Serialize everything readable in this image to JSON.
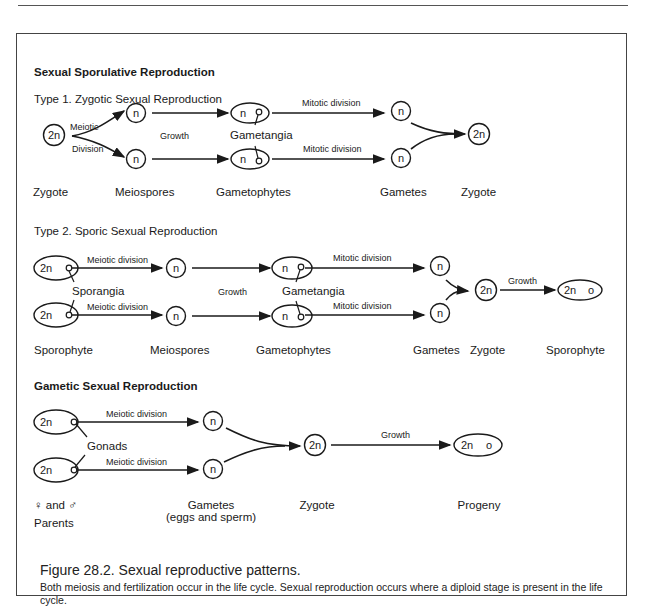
{
  "sections": {
    "sporulative_title": "Sexual Sporulative Reproduction",
    "type1": {
      "title": "Type 1.  Zygotic Sexual Reproduction",
      "arrow_meiotic_top": "Meiotic",
      "arrow_meiotic_bottom": "Division",
      "growth": "Growth",
      "gametangia": "Gametangia",
      "mitotic_top": "Mitotic division",
      "mitotic_bottom": "Mitotic division",
      "nodes": {
        "zygote": "2n",
        "meiospore": "n",
        "gametophyte_n": "n",
        "gamete": "n",
        "zygote_final": "2n"
      },
      "stage_labels": [
        "Zygote",
        "Meiospores",
        "Gametophytes",
        "Gametes",
        "Zygote"
      ]
    },
    "type2": {
      "title": "Type 2.  Sporic Sexual Reproduction",
      "meiotic_top": "Meiotic division",
      "meiotic_bottom": "Meiotic division",
      "sporangia": "Sporangia",
      "growth": "Growth",
      "gametangia": "Gametangia",
      "mitotic_top": "Mitotic division",
      "mitotic_bottom": "Mitotic division",
      "growth_final": "Growth",
      "nodes": {
        "sporophyte": "2n",
        "meiospore": "n",
        "gametophyte_n": "n",
        "gamete": "n",
        "zygote": "2n",
        "sporophyte_final": "2n",
        "sporophyte_final_o": "o"
      },
      "stage_labels": [
        "Sporophyte",
        "Meiospores",
        "Gametophytes",
        "Gametes",
        "Zygote",
        "Sporophyte"
      ]
    },
    "gametic": {
      "title": "Gametic Sexual Reproduction",
      "meiotic_top": "Meiotic division",
      "meiotic_bottom": "Meiotic division",
      "gonads": "Gonads",
      "growth": "Growth",
      "nodes": {
        "parent": "2n",
        "gamete": "n",
        "zygote": "2n",
        "progeny": "2n",
        "progeny_o": "o"
      },
      "parents_symbols": "♀  and  ♂",
      "parents_label": "Parents",
      "gametes_label": "Gametes",
      "gametes_sub": "(eggs and sperm)",
      "zygote_label": "Zygote",
      "progeny_label": "Progeny"
    }
  },
  "caption": {
    "title": "Figure 28.2. Sexual reproductive patterns.",
    "body": "Both meiosis and fertilization occur in the life cycle. Sexual reproduction occurs where a diploid stage is present in the life cycle."
  }
}
